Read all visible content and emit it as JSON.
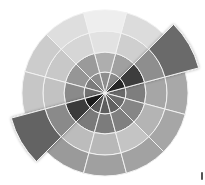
{
  "diagram": {
    "type": "segmented-wheel",
    "center": [
      105,
      93
    ],
    "ring_radii": [
      21,
      41,
      62,
      83
    ],
    "extended_outer_radius": 97,
    "segment_count": 12,
    "segment_width_deg": 30,
    "separator_color": "#f2f2f2",
    "segments": [
      {
        "angle": 0,
        "highlighted": false,
        "rings": [
          "#6a6a6a",
          "#7e7e7e",
          "#a6a6a6",
          "#a8a8a8"
        ]
      },
      {
        "angle": 30,
        "highlighted": true,
        "rings": [
          "#262626",
          "#3e3e3e",
          "#8e8e8e",
          "#6a6a6a"
        ]
      },
      {
        "angle": 60,
        "highlighted": false,
        "rings": [
          "#8a8a8a",
          "#a0a0a0",
          "#cfcfcf",
          "#dcdcdc"
        ]
      },
      {
        "angle": 90,
        "highlighted": false,
        "rings": [
          "#8e8e8e",
          "#aeaeae",
          "#e2e2e2",
          "#eeeeee"
        ]
      },
      {
        "angle": 120,
        "highlighted": false,
        "rings": [
          "#8c8c8c",
          "#9a9a9a",
          "#d6d6d6",
          "#dedede"
        ]
      },
      {
        "angle": 150,
        "highlighted": false,
        "rings": [
          "#7c7c7c",
          "#969696",
          "#c8c8c8",
          "#cccccc"
        ]
      },
      {
        "angle": 180,
        "highlighted": false,
        "rings": [
          "#707070",
          "#8a8a8a",
          "#c2c2c2",
          "#c6c6c6"
        ]
      },
      {
        "angle": 210,
        "highlighted": true,
        "rings": [
          "#1e1e1e",
          "#3a3a3a",
          "#8a8a8a",
          "#646464"
        ]
      },
      {
        "angle": 240,
        "highlighted": false,
        "rings": [
          "#5a5a5a",
          "#7a7a7a",
          "#bcbcbc",
          "#9a9a9a"
        ]
      },
      {
        "angle": 270,
        "highlighted": false,
        "rings": [
          "#5e5e5e",
          "#7c7c7c",
          "#b8b8b8",
          "#a0a0a0"
        ]
      },
      {
        "angle": 300,
        "highlighted": false,
        "rings": [
          "#626262",
          "#808080",
          "#c4c4c4",
          "#a2a2a2"
        ]
      },
      {
        "angle": 330,
        "highlighted": false,
        "rings": [
          "#6c6c6c",
          "#868686",
          "#b4b4b4",
          "#a6a6a6"
        ]
      }
    ]
  }
}
